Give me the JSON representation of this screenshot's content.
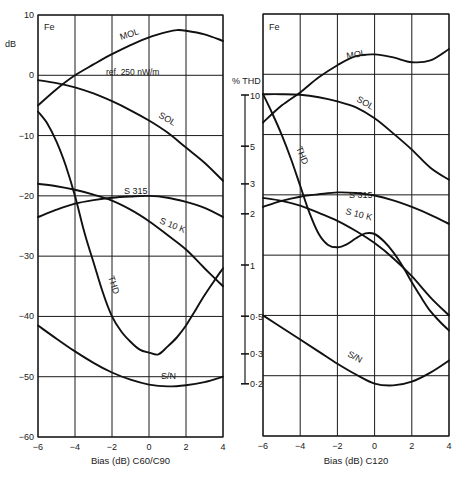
{
  "chart_data": [
    {
      "type": "line",
      "title": "Fe",
      "xlabel": "Bias (dB) C60/C90",
      "ylabel": "dB",
      "xlim": [
        -6,
        4
      ],
      "ylim": [
        -60,
        10
      ],
      "grid": true,
      "x_ticks": [
        -6,
        -4,
        -2,
        0,
        2,
        4
      ],
      "x_tick_labels": [
        "−6",
        "−4",
        "−2",
        "0",
        "2",
        "4"
      ],
      "y_ticks": [
        10,
        0,
        -10,
        -20,
        -30,
        -40,
        -50,
        -60
      ],
      "y_tick_labels": [
        "10",
        "0",
        "−10",
        "−20",
        "−30",
        "−40",
        "−50",
        "−60"
      ],
      "annotations": [
        "ref. 250 nW/m"
      ],
      "series": [
        {
          "name": "MOL",
          "x": [
            -6,
            -5,
            -4,
            -3,
            -2,
            -1,
            0,
            1,
            1.5,
            2,
            3,
            4
          ],
          "values": [
            -5,
            -2.3,
            0,
            1.8,
            3.5,
            5,
            6.3,
            7.2,
            7.5,
            7.4,
            6.8,
            5.7
          ]
        },
        {
          "name": "SOL",
          "x": [
            -6,
            -5,
            -4,
            -3,
            -2,
            -1,
            0,
            1,
            2,
            3,
            4
          ],
          "values": [
            -0.8,
            -1.3,
            -2,
            -3,
            -4.3,
            -5.8,
            -7.5,
            -9.5,
            -12,
            -14.5,
            -17.5
          ]
        },
        {
          "name": "S 315",
          "x": [
            -6,
            -5,
            -4,
            -3,
            -2,
            -1,
            0,
            1,
            2,
            3,
            4
          ],
          "values": [
            -23.5,
            -22.3,
            -21.3,
            -20.7,
            -20.3,
            -20.1,
            -20,
            -20.3,
            -21,
            -22,
            -23.5
          ]
        },
        {
          "name": "S 10 K",
          "x": [
            -6,
            -5,
            -4,
            -3,
            -2,
            -1,
            0,
            1,
            2,
            3,
            4
          ],
          "values": [
            -18,
            -18.4,
            -19,
            -19.8,
            -20.8,
            -22.3,
            -24.2,
            -26.5,
            -28.9,
            -32,
            -35
          ]
        },
        {
          "name": "THD",
          "x": [
            -6,
            -5.5,
            -5,
            -4.5,
            -4,
            -3.5,
            -3,
            -2.5,
            -2,
            -1.5,
            -1,
            -0.5,
            0,
            0.5,
            1,
            1.5,
            2,
            2.5,
            3,
            3.5,
            4
          ],
          "values": [
            -6,
            -8,
            -11,
            -15,
            -20,
            -26,
            -31,
            -36,
            -40,
            -42.5,
            -44.2,
            -45.5,
            -46,
            -46.3,
            -45,
            -43.5,
            -41.5,
            -39,
            -36.5,
            -34.2,
            -32
          ]
        },
        {
          "name": "S/N",
          "x": [
            -6,
            -5,
            -4,
            -3,
            -2,
            -1,
            0,
            1,
            2,
            3,
            4
          ],
          "values": [
            -41.5,
            -43.7,
            -45.8,
            -47.7,
            -49.3,
            -50.5,
            -51.3,
            -51.6,
            -51.4,
            -50.9,
            -50
          ]
        }
      ]
    },
    {
      "type": "line",
      "title": "Fe",
      "xlabel": "Bias (dB) C120",
      "ylabel": "% THD",
      "xlim": [
        -6,
        4
      ],
      "ylim": [
        -60,
        10
      ],
      "grid": true,
      "x_ticks": [
        -6,
        -4,
        -2,
        0,
        2,
        4
      ],
      "x_tick_labels": [
        "−6",
        "−4",
        "−2",
        "0",
        "2",
        "4"
      ],
      "y_ticks_dB_grid": [
        10,
        0,
        -10,
        -20,
        -30,
        -40,
        -50,
        -60
      ],
      "thd_axis": {
        "label": "% THD",
        "ticks": [
          10,
          5,
          3,
          2,
          1,
          0.5,
          0.3,
          0.2
        ],
        "tick_labels": [
          "10",
          "5",
          "3",
          "2",
          "1",
          "0·5",
          "0·3",
          "0·2"
        ]
      },
      "series": [
        {
          "name": "MOL",
          "x": [
            -6,
            -5,
            -4,
            -3,
            -2,
            -1,
            0,
            1,
            2,
            3,
            4
          ],
          "values": [
            -8,
            -5.2,
            -3,
            -0.5,
            1.5,
            3,
            3.3,
            2.8,
            2,
            2.3,
            4.2
          ]
        },
        {
          "name": "SOL",
          "x": [
            -6,
            -5,
            -4,
            -3,
            -2,
            -1,
            0,
            1,
            2,
            3,
            4
          ],
          "values": [
            -3.3,
            -3.3,
            -3.4,
            -3.8,
            -4.5,
            -5.5,
            -7.3,
            -9.8,
            -12.5,
            -15.5,
            -17.5
          ]
        },
        {
          "name": "S 315",
          "x": [
            -6,
            -5,
            -4,
            -3,
            -2,
            -1,
            0,
            1,
            2,
            3,
            4
          ],
          "values": [
            -22,
            -21,
            -20.3,
            -19.9,
            -19.6,
            -19.7,
            -20.1,
            -20.9,
            -22,
            -23.3,
            -24.8
          ]
        },
        {
          "name": "S 10 K",
          "x": [
            -6,
            -5,
            -4,
            -3,
            -2,
            -1,
            0,
            1,
            2,
            3,
            4
          ],
          "values": [
            -20.5,
            -21,
            -21.8,
            -23,
            -24.3,
            -26,
            -28,
            -30.5,
            -33.5,
            -37,
            -40
          ]
        },
        {
          "name": "THD",
          "x": [
            -6,
            -5.5,
            -5,
            -4.5,
            -4,
            -3.5,
            -3,
            -2.5,
            -2,
            -1.5,
            -1,
            -0.5,
            0,
            0.5,
            1,
            1.5,
            2,
            2.5,
            3,
            3.5,
            4
          ],
          "values": [
            -3.3,
            -6.5,
            -10,
            -14,
            -18.5,
            -23,
            -26.5,
            -28.3,
            -28.7,
            -28.2,
            -27.2,
            -26.4,
            -26.5,
            -27.7,
            -29.5,
            -31.8,
            -34.5,
            -37,
            -39.3,
            -41,
            -42.5
          ]
        },
        {
          "name": "S/N",
          "x": [
            -6,
            -5,
            -4,
            -3,
            -2,
            -1,
            0,
            1,
            2,
            3,
            4
          ],
          "values": [
            -40,
            -42,
            -44,
            -46,
            -48,
            -49.8,
            -51.3,
            -51.6,
            -51,
            -49.5,
            -47.5
          ]
        }
      ]
    }
  ],
  "left": {
    "title": "Fe",
    "ylabel": "dB",
    "ref_note": "ref. 250 nW/m",
    "xlabel": "Bias (dB) C60/C90"
  },
  "right": {
    "title": "Fe",
    "thd_label": "% THD",
    "xlabel": "Bias (dB) C120"
  },
  "colors": {
    "ink": "#1a1a1a",
    "background": "#ffffff"
  }
}
